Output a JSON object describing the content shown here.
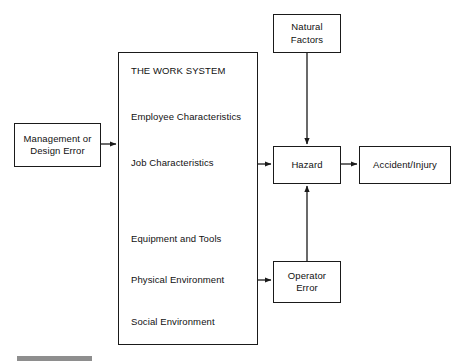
{
  "diagram": {
    "background_color": "#ffffff",
    "line_color": "#1a1a1a",
    "nodes": {
      "management_design_error": {
        "label": "Management or\nDesign Error"
      },
      "work_system": {
        "title": "THE WORK SYSTEM",
        "items": [
          "Employee Characteristics",
          "Job Characteristics",
          "Equipment and Tools",
          "Physical Environment",
          "Social Environment"
        ]
      },
      "natural_factors": {
        "label": "Natural\nFactors"
      },
      "hazard": {
        "label": "Hazard"
      },
      "operator_error": {
        "label": "Operator\nError"
      },
      "accident_injury": {
        "label": "Accident/Injury"
      }
    },
    "edges": [
      {
        "name": "management-to-work-system",
        "from": "management_design_error",
        "to": "work_system",
        "direction": "right"
      },
      {
        "name": "work-system-to-hazard",
        "from": "work_system",
        "to": "hazard",
        "direction": "right"
      },
      {
        "name": "natural-factors-to-hazard",
        "from": "natural_factors",
        "to": "hazard",
        "direction": "down"
      },
      {
        "name": "hazard-to-accident-injury",
        "from": "hazard",
        "to": "accident_injury",
        "direction": "right"
      },
      {
        "name": "work-system-to-operator-error",
        "from": "work_system",
        "to": "operator_error",
        "direction": "right"
      },
      {
        "name": "operator-error-to-hazard",
        "from": "operator_error",
        "to": "hazard",
        "direction": "up"
      }
    ],
    "footer_rule_color": "#8e8e8e"
  }
}
